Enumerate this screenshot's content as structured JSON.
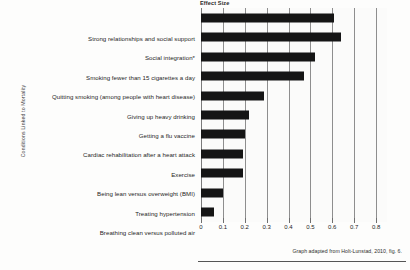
{
  "chart_data": {
    "type": "bar",
    "orientation": "horizontal",
    "title": "Effect Size",
    "xlabel": "",
    "ylabel": "Conditions Linked to Mortality",
    "categories": [
      "Strong relationships and social support",
      "Social integration*",
      "Smoking fewer than 15 cigarettes a day",
      "Quitting smoking (among people with heart disease)",
      "Giving up heavy drinking",
      "Getting a flu vaccine",
      "Cardiac rehabilitation after a heart attack",
      "Exercise",
      "Being lean versus  overweight (BMI)",
      "Treating hypertension",
      "Breathing clean versus polluted air"
    ],
    "values": [
      0.61,
      0.64,
      0.52,
      0.47,
      0.29,
      0.22,
      0.2,
      0.19,
      0.19,
      0.1,
      0.06
    ],
    "xlim": [
      0,
      0.85
    ],
    "xticks": [
      0,
      0.1,
      0.2,
      0.3,
      0.4,
      0.5,
      0.6,
      0.7,
      0.8
    ],
    "xtick_labels": [
      "0",
      "0.1",
      "0.2",
      "0.3",
      "0.4",
      "0.5",
      "0.6",
      "0.7",
      "0.8"
    ],
    "grid": true,
    "legend": false,
    "bar_color": "#151515",
    "annotation": "Graph adapted from Holt-Lunstad, 2010, fig. 6."
  }
}
